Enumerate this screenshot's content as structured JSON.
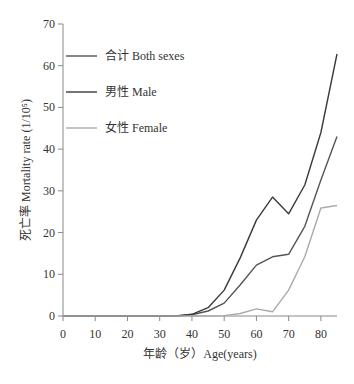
{
  "chart_data": {
    "type": "line",
    "title": "",
    "xlabel": "年龄（岁）Age(years)",
    "ylabel": "死亡率 Mortality rate (1/10⁵)",
    "xlim": [
      0,
      85
    ],
    "ylim": [
      0,
      70
    ],
    "xticks": [
      0,
      10,
      20,
      30,
      40,
      50,
      60,
      70,
      80
    ],
    "yticks": [
      0,
      10,
      20,
      30,
      40,
      50,
      60,
      70
    ],
    "grid": false,
    "legend_position": "upper-left",
    "x": [
      0,
      5,
      10,
      15,
      20,
      25,
      30,
      35,
      40,
      45,
      50,
      55,
      60,
      65,
      70,
      75,
      80,
      85
    ],
    "series": [
      {
        "name": "合计 Both sexes",
        "color": "#555555",
        "values": [
          0,
          0,
          0,
          0,
          0,
          0,
          0,
          0,
          0.3,
          1.2,
          3.1,
          7.5,
          12.2,
          14.2,
          14.8,
          21.5,
          32.6,
          43.0
        ]
      },
      {
        "name": "男性 Male",
        "color": "#3a3a3a",
        "values": [
          0,
          0,
          0,
          0,
          0,
          0,
          0,
          0,
          0.4,
          2.0,
          6.2,
          14.0,
          23.0,
          28.5,
          24.5,
          31.4,
          44.0,
          62.8
        ]
      },
      {
        "name": "女性 Female",
        "color": "#aaaaaa",
        "values": [
          0,
          0,
          0,
          0,
          0,
          0,
          0,
          0,
          0,
          0,
          0.1,
          0.6,
          1.7,
          1.0,
          6.2,
          14.2,
          25.9,
          26.5
        ]
      }
    ]
  },
  "legend": {
    "items": [
      {
        "label": "合计  Both sexes",
        "color": "#555555"
      },
      {
        "label": "男性  Male",
        "color": "#3a3a3a"
      },
      {
        "label": "女性  Female",
        "color": "#aaaaaa"
      }
    ]
  },
  "axis": {
    "x_title": "年龄（岁）Age(years)",
    "y_title": "死亡率 Mortality rate (1/10⁵)"
  }
}
